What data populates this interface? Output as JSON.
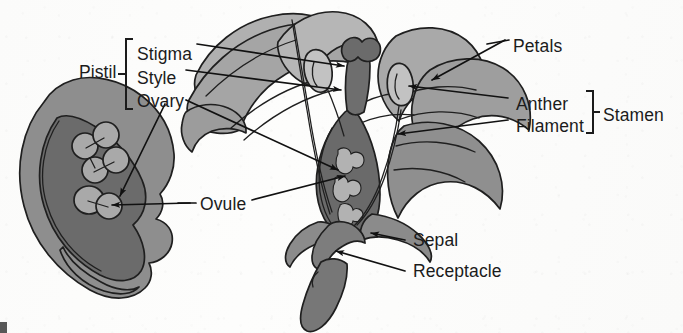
{
  "diagram": {
    "labels": [
      {
        "id": "pistil",
        "text": "Pistil",
        "x": 79,
        "y": 64
      },
      {
        "id": "stigma",
        "text": "Stigma",
        "x": 137,
        "y": 46
      },
      {
        "id": "style",
        "text": "Style",
        "x": 137,
        "y": 70
      },
      {
        "id": "ovary",
        "text": "Ovary",
        "x": 137,
        "y": 93
      },
      {
        "id": "petals",
        "text": "Petals",
        "x": 513,
        "y": 38
      },
      {
        "id": "anther",
        "text": "Anther",
        "x": 516,
        "y": 96
      },
      {
        "id": "filament",
        "text": "Filament",
        "x": 516,
        "y": 118
      },
      {
        "id": "stamen",
        "text": "Stamen",
        "x": 603,
        "y": 107
      },
      {
        "id": "ovule",
        "text": "Ovule",
        "x": 200,
        "y": 204
      },
      {
        "id": "sepal",
        "text": "Sepal",
        "x": 413,
        "y": 238
      },
      {
        "id": "receptacle",
        "text": "Receptacle",
        "x": 413,
        "y": 270
      }
    ],
    "brackets": [
      {
        "id": "pistil-bracket",
        "text": "[",
        "x": 125,
        "y": 35,
        "height": 74
      },
      {
        "id": "stamen-bracket",
        "text": "]",
        "x": 586,
        "y": 88,
        "height": 44
      }
    ],
    "colors": {
      "petal_light": "#b4b4b4",
      "petal_mid": "#9a9a9a",
      "petal_shade": "#8c8c8c",
      "ovary_dark": "#6e6e6e",
      "ovary_core": "#5a5a5a",
      "ovule_light": "#a8a8a8",
      "outline": "#1f1f1f",
      "label_text": "#1b1b1b",
      "background": "#fcfcfb"
    },
    "parts": {
      "inset": "magnified-ovary-cross-section",
      "main": "flower-longitudinal-section"
    }
  }
}
